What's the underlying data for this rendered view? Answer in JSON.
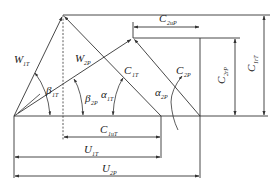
{
  "diagram": {
    "labels": {
      "W1T": {
        "main": "W",
        "sub": "1T"
      },
      "W2P": {
        "main": "W",
        "sub": "2P"
      },
      "C1T": {
        "main": "C",
        "sub": "1T"
      },
      "C2P": {
        "main": "C",
        "sub": "2P"
      },
      "C2uP": {
        "main": "C",
        "sub": "2uP"
      },
      "C2rP": {
        "main": "C",
        "sub": "2rP"
      },
      "C1rT": {
        "main": "C",
        "sub": "1rT"
      },
      "C1uT": {
        "main": "C",
        "sub": "1uT"
      },
      "U1T": {
        "main": "U",
        "sub": "1T"
      },
      "U2P": {
        "main": "U",
        "sub": "2P"
      },
      "beta1T": {
        "main": "β",
        "sub": "1T"
      },
      "beta2P": {
        "main": "β",
        "sub": "2P"
      },
      "alpha1T": {
        "main": "α",
        "sub": "1T"
      },
      "alpha2P": {
        "main": "α",
        "sub": "2P"
      }
    },
    "colors": {
      "line": "#333333",
      "text": "#222222",
      "background": "#ffffff"
    }
  }
}
